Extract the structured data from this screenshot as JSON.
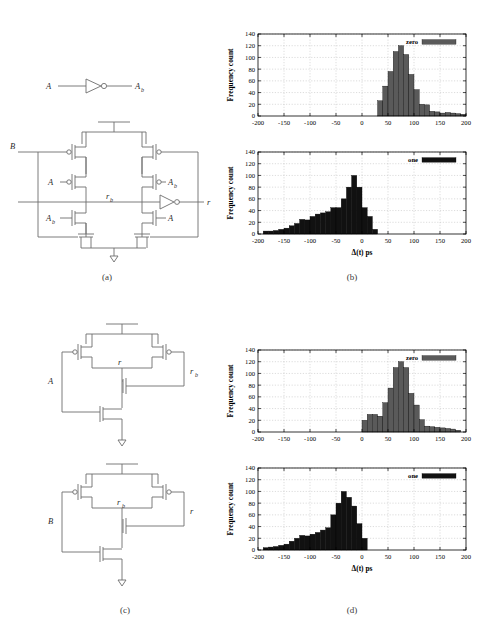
{
  "figure": {
    "captions": [
      {
        "key": "a",
        "label": "(a)"
      },
      {
        "key": "b",
        "label": "(b)"
      },
      {
        "key": "c",
        "label": "(c)"
      },
      {
        "key": "d",
        "label": "(d)"
      }
    ]
  },
  "circuit_a": {
    "title": "(a)",
    "inverter_input_label": "A",
    "inverter_output_label": "A",
    "inverter_output_sub": "b",
    "input_b_label": "B",
    "node_rb_label": "r",
    "node_rb_sub": "b",
    "output_label": "r",
    "left_pmos_label": "A",
    "left_nmos_label": "A",
    "left_nmos_sub": "b",
    "right_pmos_label": "A",
    "right_pmos_sub": "b",
    "right_nmos_label": "A"
  },
  "circuit_c_top": {
    "input_label": "A",
    "node_r_label": "r",
    "node_rb_label": "r",
    "node_rb_sub": "b"
  },
  "circuit_c_bottom": {
    "input_label": "B",
    "node_rb_label": "r",
    "node_rb_sub": "b",
    "node_r_label": "r"
  },
  "chart_data": [
    {
      "id": "b-zero",
      "type": "bar",
      "title": "",
      "xlabel": "",
      "ylabel": "Frequency count",
      "legend": [
        "zero"
      ],
      "legend_position": "top-right",
      "color": "#5a5a5a",
      "grid": true,
      "xlim": [
        -200,
        200
      ],
      "ylim": [
        0,
        140
      ],
      "xticks": [
        -200,
        -150,
        -100,
        -50,
        0,
        50,
        100,
        150,
        200
      ],
      "yticks": [
        0,
        20,
        40,
        60,
        80,
        100,
        120,
        140
      ],
      "bin_width": 10,
      "bin_starts": [
        30,
        40,
        50,
        60,
        70,
        80,
        90,
        100,
        110,
        120,
        130,
        140,
        150,
        160,
        170,
        180,
        190
      ],
      "values": [
        26,
        51,
        76,
        110,
        120,
        105,
        71,
        45,
        20,
        19,
        8,
        7,
        5,
        6,
        5,
        4,
        3
      ]
    },
    {
      "id": "b-one",
      "type": "bar",
      "title": "",
      "xlabel": "Δ(t) ps",
      "ylabel": "Frequency count",
      "legend": [
        "one"
      ],
      "legend_position": "top-right",
      "color": "#111111",
      "grid": true,
      "xlim": [
        -200,
        200
      ],
      "ylim": [
        0,
        140
      ],
      "xticks": [
        -200,
        -150,
        -100,
        -50,
        0,
        50,
        100,
        150,
        200
      ],
      "yticks": [
        0,
        20,
        40,
        60,
        80,
        100,
        120,
        140
      ],
      "bin_width": 10,
      "bin_starts": [
        -190,
        -180,
        -170,
        -160,
        -150,
        -140,
        -130,
        -120,
        -110,
        -100,
        -90,
        -80,
        -70,
        -60,
        -50,
        -40,
        -30,
        -20,
        -10,
        0,
        10,
        20
      ],
      "values": [
        5,
        5,
        6,
        8,
        10,
        14,
        18,
        25,
        24,
        30,
        34,
        36,
        38,
        45,
        45,
        60,
        80,
        100,
        80,
        45,
        30,
        8
      ]
    },
    {
      "id": "d-zero",
      "type": "bar",
      "title": "",
      "xlabel": "",
      "ylabel": "Frequency count",
      "legend": [
        "zero"
      ],
      "legend_position": "top-right",
      "color": "#5a5a5a",
      "grid": true,
      "xlim": [
        -200,
        200
      ],
      "ylim": [
        0,
        140
      ],
      "xticks": [
        -200,
        -150,
        -100,
        -50,
        0,
        50,
        100,
        150,
        200
      ],
      "yticks": [
        0,
        20,
        40,
        60,
        80,
        100,
        120,
        140
      ],
      "bin_width": 10,
      "bin_starts": [
        0,
        10,
        20,
        30,
        40,
        50,
        60,
        70,
        80,
        90,
        100,
        110,
        120,
        130,
        140,
        150,
        160,
        170,
        180
      ],
      "values": [
        20,
        30,
        30,
        27,
        50,
        75,
        110,
        120,
        110,
        66,
        46,
        21,
        10,
        9,
        8,
        7,
        6,
        5,
        3
      ]
    },
    {
      "id": "d-one",
      "type": "bar",
      "title": "",
      "xlabel": "Δ(t) ps",
      "ylabel": "Frequency count",
      "legend": [
        "one"
      ],
      "legend_position": "top-right",
      "color": "#111111",
      "grid": true,
      "xlim": [
        -200,
        200
      ],
      "ylim": [
        0,
        140
      ],
      "xticks": [
        -200,
        -150,
        -100,
        -50,
        0,
        50,
        100,
        150,
        200
      ],
      "yticks": [
        0,
        20,
        40,
        60,
        80,
        100,
        120,
        140
      ],
      "bin_width": 10,
      "bin_starts": [
        -190,
        -180,
        -170,
        -160,
        -150,
        -140,
        -130,
        -120,
        -110,
        -100,
        -90,
        -80,
        -70,
        -60,
        -50,
        -40,
        -30,
        -20,
        -10
      ],
      "values": [
        4,
        5,
        6,
        8,
        10,
        15,
        20,
        25,
        24,
        27,
        30,
        34,
        38,
        60,
        80,
        100,
        90,
        75,
        45
      ],
      "last_bin_start": 0,
      "last_bin_value": 20
    }
  ]
}
